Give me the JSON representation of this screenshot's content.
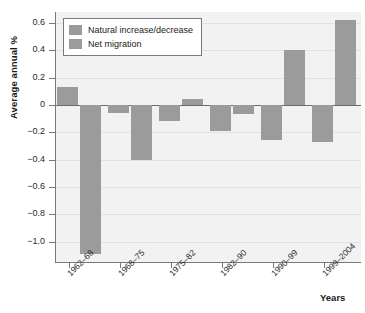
{
  "chart_data": {
    "type": "bar",
    "title": "",
    "subtitle": "",
    "xlabel": "Years",
    "ylabel": "Average annual %",
    "categories": [
      "1962–68",
      "1968–75",
      "1975–82",
      "1982–90",
      "1990–99",
      "1999–2004"
    ],
    "series": [
      {
        "name": "Natural increase/decrease",
        "color": "#9b9b9b",
        "values": [
          0.13,
          -0.06,
          -0.12,
          -0.19,
          -0.26,
          -0.27
        ]
      },
      {
        "name": "Net migration",
        "color": "#9b9b9b",
        "values": [
          -1.09,
          -0.4,
          0.04,
          -0.07,
          0.4,
          0.62
        ]
      }
    ],
    "ylim": [
      -1.15,
      0.68
    ],
    "yticks": [
      0.6,
      0.4,
      0.2,
      0,
      -0.2,
      -0.4,
      -0.6,
      -0.8,
      -1.0
    ],
    "ytick_labels": [
      "0.6",
      "0.4",
      "0.2",
      "0",
      "−0.2",
      "−0.4",
      "−0.6",
      "−0.8",
      "−1.0"
    ],
    "grid": true,
    "grid_axis": "y",
    "legend_position": "top-left",
    "zero_line": true,
    "plot_background": "#f2f2f2"
  },
  "legend": {
    "entries": [
      {
        "label": "Natural increase/decrease"
      },
      {
        "label": "Net migration"
      }
    ]
  },
  "axes": {
    "y_title": "Average annual %",
    "x_title": "Years"
  }
}
